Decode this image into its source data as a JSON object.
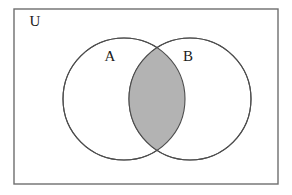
{
  "figure": {
    "width": 292,
    "height": 195,
    "background_color": "#ffffff"
  },
  "universe": {
    "label": "U",
    "label_x": 35,
    "label_y": 23,
    "rect": {
      "x": 14,
      "y": 9,
      "width": 264,
      "height": 175
    },
    "border_color": "#6e6e6e",
    "border_width": 1.4,
    "fill_color": "#ffffff"
  },
  "sets": [
    {
      "label": "A",
      "label_x": 110,
      "label_y": 58,
      "cx": 124,
      "cy": 99,
      "r": 61,
      "stroke_color": "#4d4d4d",
      "stroke_width": 1.1,
      "fill_color": "#ffffff"
    },
    {
      "label": "B",
      "label_x": 188,
      "label_y": 58,
      "cx": 190,
      "cy": 99,
      "r": 61,
      "stroke_color": "#4d4d4d",
      "stroke_width": 1.1,
      "fill_color": "#ffffff"
    }
  ],
  "intersection": {
    "name": "A intersect B",
    "shaded": true,
    "fill_color": "#b3b3b3",
    "stroke_color": "#4d4d4d",
    "stroke_width": 1.1,
    "top_point": {
      "x": 157,
      "y": 48
    },
    "bottom_point": {
      "x": 157,
      "y": 150
    }
  },
  "chart_data": {
    "type": "diagram",
    "diagram_type": "venn",
    "title": "",
    "universe_label": "U",
    "set_labels": [
      "A",
      "B"
    ],
    "shaded_regions": [
      "A ∩ B"
    ],
    "unshaded_regions": [
      "A only",
      "B only",
      "outside A and B"
    ],
    "legend": [],
    "annotations": []
  }
}
